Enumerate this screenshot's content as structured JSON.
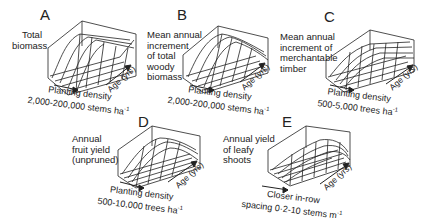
{
  "figure": {
    "panels": [
      {
        "id": "A",
        "letter": "A",
        "z_label": "Total\nbiomass",
        "x_label_line1": "Planting density",
        "x_label_line2": "2,000-200,000 stems ha",
        "x_unit_exp": "-1",
        "age_label": "Age (yrs)",
        "surface_shape": "rising-plateau"
      },
      {
        "id": "B",
        "letter": "B",
        "z_label": "Mean annual\nincrement\nof total\nwoody\nbiomass",
        "x_label_line1": "Planting density",
        "x_label_line2": "2,000-200,000 stems ha",
        "x_unit_exp": "-1",
        "age_label": "Age (yrs)",
        "surface_shape": "peaked-ridge"
      },
      {
        "id": "C",
        "letter": "C",
        "z_label": "Mean annual\nincrement of\nmerchantable\ntimber",
        "x_label_line1": "Planting density",
        "x_label_line2": "500-5,000 trees ha",
        "x_unit_exp": "-1",
        "age_label": "Age (yrs)",
        "surface_shape": "rising-plateau"
      },
      {
        "id": "D",
        "letter": "D",
        "z_label": "Annual\nfruit yield\n(unpruned)",
        "x_label_line1": "Planting density",
        "x_label_line2": "500-10,000 trees ha",
        "x_unit_exp": "-1",
        "age_label": "Age (yrs)",
        "surface_shape": "hump"
      },
      {
        "id": "E",
        "letter": "E",
        "z_label": "Annual yield\nof leafy\nshoots",
        "x_label_line1": "Closer in-row",
        "x_label_line2": "spacing 0·2-10 stems m",
        "x_unit_exp": "-1",
        "age_label": "Age (yrs)",
        "surface_shape": "low-ridge"
      }
    ]
  }
}
